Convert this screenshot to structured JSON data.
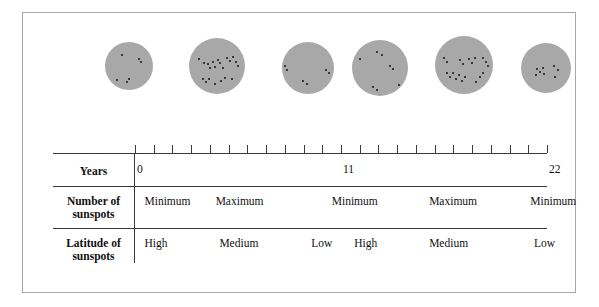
{
  "figure": {
    "disk_color": "#a8a8a8",
    "spot_color": "#141414",
    "rule_color": "#3a3a3a",
    "border_color": "#a8a8a8"
  },
  "table": {
    "row_labels": {
      "years": "Years",
      "number": "Number of\nsunspots",
      "latitude": "Latitude of\nsunspots"
    },
    "axis": {
      "ticks_total": 23,
      "labels": [
        {
          "text": "0",
          "year": 0
        },
        {
          "text": "11",
          "year": 11
        },
        {
          "text": "22",
          "year": 22
        }
      ]
    },
    "number_of_sunspots": [
      {
        "text": "Minimum",
        "year": 0.4
      },
      {
        "text": "Maximum",
        "year": 4.2
      },
      {
        "text": "Minimum",
        "year": 10.4
      },
      {
        "text": "Maximum",
        "year": 15.6
      },
      {
        "text": "Minimum",
        "year": 21.0
      }
    ],
    "latitude_of_sunspots": [
      {
        "text": "High",
        "year": 0.4
      },
      {
        "text": "Medium",
        "year": 4.4
      },
      {
        "text": "Low",
        "year": 9.3
      },
      {
        "text": "High",
        "year": 11.6
      },
      {
        "text": "Medium",
        "year": 15.6
      },
      {
        "text": "Low",
        "year": 21.2
      }
    ]
  },
  "chart_data": {
    "type": "scatter",
    "xlabel": "Years",
    "xlim": [
      0,
      22
    ],
    "grid": false,
    "legend": null,
    "disks": [
      {
        "index": 0,
        "label": "Minimum",
        "latitude": "High",
        "year": 0,
        "cx": 106,
        "cy": 53,
        "r": 24,
        "spot_count": 6,
        "spots": [
          [
            -7,
            -11
          ],
          [
            10,
            -7
          ],
          [
            12,
            -4
          ],
          [
            -12,
            14
          ],
          [
            -2,
            16
          ],
          [
            0,
            13
          ]
        ]
      },
      {
        "index": 1,
        "label": "Maximum",
        "latitude": "Medium",
        "year": 4,
        "cx": 194,
        "cy": 53,
        "r": 28,
        "spot_count": 21,
        "spots": [
          [
            -18,
            -7
          ],
          [
            -13,
            -3
          ],
          [
            -9,
            -2
          ],
          [
            -7,
            2
          ],
          [
            -4,
            -4
          ],
          [
            -2,
            1
          ],
          [
            1,
            -6
          ],
          [
            3,
            -3
          ],
          [
            6,
            2
          ],
          [
            10,
            -8
          ],
          [
            13,
            -5
          ],
          [
            16,
            -9
          ],
          [
            19,
            -4
          ],
          [
            21,
            0
          ],
          [
            -14,
            13
          ],
          [
            -11,
            16
          ],
          [
            -8,
            13
          ],
          [
            -2,
            18
          ],
          [
            4,
            15
          ],
          [
            8,
            12
          ],
          [
            15,
            13
          ]
        ]
      },
      {
        "index": 2,
        "label": "Minimum",
        "latitude": "Low",
        "year": 10,
        "cx": 285,
        "cy": 55,
        "r": 26,
        "spot_count": 6,
        "spots": [
          [
            -23,
            -2
          ],
          [
            -21,
            2
          ],
          [
            18,
            2
          ],
          [
            21,
            5
          ],
          [
            -5,
            13
          ],
          [
            -1,
            16
          ]
        ]
      },
      {
        "index": 3,
        "label": "High",
        "latitude": "High",
        "year": 12,
        "cx": 357,
        "cy": 55,
        "r": 28,
        "spot_count": 8,
        "spots": [
          [
            -20,
            -9
          ],
          [
            -3,
            -16
          ],
          [
            2,
            -13
          ],
          [
            10,
            -2
          ],
          [
            13,
            1
          ],
          [
            -7,
            19
          ],
          [
            -3,
            22
          ],
          [
            19,
            17
          ]
        ]
      },
      {
        "index": 4,
        "label": "Maximum",
        "latitude": "Medium",
        "year": 16,
        "cx": 441,
        "cy": 52,
        "r": 29,
        "spot_count": 20,
        "spots": [
          [
            -20,
            -7
          ],
          [
            -17,
            -3
          ],
          [
            -4,
            -5
          ],
          [
            -1,
            -1
          ],
          [
            5,
            -6
          ],
          [
            8,
            -2
          ],
          [
            11,
            -7
          ],
          [
            19,
            -7
          ],
          [
            22,
            -3
          ],
          [
            24,
            1
          ],
          [
            -17,
            8
          ],
          [
            -14,
            12
          ],
          [
            -11,
            8
          ],
          [
            -8,
            14
          ],
          [
            -5,
            10
          ],
          [
            -2,
            16
          ],
          [
            1,
            12
          ],
          [
            16,
            12
          ],
          [
            19,
            8
          ],
          [
            12,
            17
          ]
        ]
      },
      {
        "index": 5,
        "label": "Minimum",
        "latitude": "Low",
        "year": 21,
        "cx": 523,
        "cy": 55,
        "r": 25,
        "spot_count": 8,
        "spots": [
          [
            -9,
            1
          ],
          [
            -6,
            4
          ],
          [
            -3,
            0
          ],
          [
            -2,
            6
          ],
          [
            -10,
            7
          ],
          [
            8,
            -2
          ],
          [
            12,
            2
          ],
          [
            9,
            9
          ]
        ]
      }
    ]
  }
}
